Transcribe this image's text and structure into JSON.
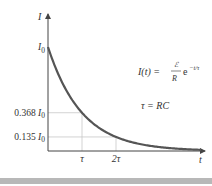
{
  "chart_data": {
    "type": "line",
    "title": "",
    "xlabel": "t",
    "ylabel": "I",
    "x_range": [
      0,
      4.6
    ],
    "y_range": [
      0,
      1.3
    ],
    "grid": false,
    "y_ticks": [
      {
        "value": 1.0,
        "label_main": "I",
        "label_sub": "0",
        "prefix": ""
      },
      {
        "value": 0.368,
        "label_main": "I",
        "label_sub": "0",
        "prefix": "0.368 "
      },
      {
        "value": 0.135,
        "label_main": "I",
        "label_sub": "0",
        "prefix": "0.135 "
      }
    ],
    "x_ticks": [
      {
        "value": 1,
        "label": "τ"
      },
      {
        "value": 2,
        "label": "2τ"
      }
    ],
    "guide_lines": [
      {
        "x": 1,
        "y": 0.368
      },
      {
        "x": 2,
        "y": 0.135
      }
    ],
    "series": [
      {
        "name": "I(t)",
        "function": "exp(-t/τ)",
        "color": "#555555",
        "x_start": 0,
        "x_end": 4.5
      }
    ],
    "annotations": [
      {
        "text_lhs": "I(t) = ",
        "numerator": "ℰ",
        "denominator": "R",
        "tail": "e",
        "exponent": "−t/τ"
      },
      {
        "text": "τ = RC"
      }
    ]
  },
  "colors": {
    "axis": "#444444",
    "curve": "#555555",
    "guide": "#c8c8c8",
    "bottom_bar": "#b8b8b8"
  }
}
